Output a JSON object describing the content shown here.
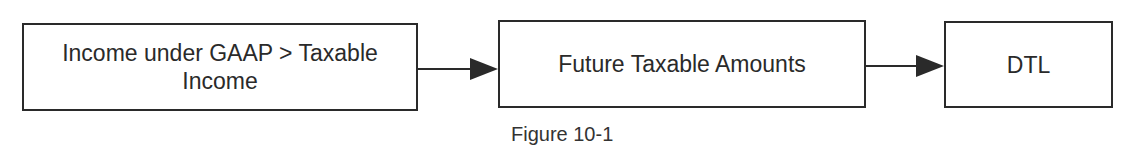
{
  "diagram": {
    "type": "flowchart",
    "nodes": [
      {
        "id": "n1",
        "label": "Income under GAAP > Taxable Income",
        "line1": "Income under GAAP > Taxable",
        "line2": "Income"
      },
      {
        "id": "n2",
        "label": "Future Taxable Amounts"
      },
      {
        "id": "n3",
        "label": "DTL"
      }
    ],
    "edges": [
      {
        "from": "n1",
        "to": "n2"
      },
      {
        "from": "n2",
        "to": "n3"
      }
    ],
    "caption": "Figure 10-1",
    "colors": {
      "stroke": "#2a2a2a",
      "background": "#ffffff",
      "text": "#2a2a2a"
    }
  }
}
